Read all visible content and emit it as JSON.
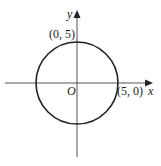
{
  "diagram": {
    "type": "circle-on-coordinate-axes",
    "circle": {
      "center": [
        0,
        0
      ],
      "radius": 5
    },
    "axis_labels": {
      "x": "x",
      "y": "y"
    },
    "origin_label": "O",
    "point_labels": [
      {
        "text": "(0, 5)",
        "point": [
          0,
          5
        ]
      },
      {
        "text": "(5, 0)",
        "point": [
          5,
          0
        ]
      }
    ]
  }
}
